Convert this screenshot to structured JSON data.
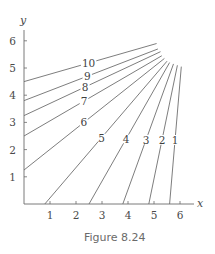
{
  "caption": "Figure 8.24",
  "chart_data": {
    "type": "line",
    "title": "",
    "xlabel": "x",
    "ylabel": "y",
    "xlim": [
      0,
      6.6
    ],
    "ylim": [
      0,
      6.6
    ],
    "xticks": [
      1,
      2,
      3,
      4,
      5,
      6
    ],
    "yticks": [
      1,
      2,
      3,
      4,
      5,
      6
    ],
    "grid": false,
    "legend": "inline labels on each curve",
    "series": [
      {
        "name": "10",
        "points": [
          [
            0,
            4.5
          ],
          [
            5.1,
            5.9
          ]
        ],
        "label_at": [
          2.45,
          5.3
        ]
      },
      {
        "name": "9",
        "points": [
          [
            0,
            3.8
          ],
          [
            5.15,
            5.7
          ]
        ],
        "label_at": [
          2.4,
          4.78
        ]
      },
      {
        "name": "8",
        "points": [
          [
            0,
            3.25
          ],
          [
            5.25,
            5.6
          ]
        ],
        "label_at": [
          2.35,
          4.3
        ]
      },
      {
        "name": "7",
        "points": [
          [
            0,
            2.5
          ],
          [
            5.3,
            5.45
          ]
        ],
        "label_at": [
          2.3,
          3.8
        ]
      },
      {
        "name": "6",
        "points": [
          [
            0,
            1.25
          ],
          [
            5.4,
            5.35
          ]
        ],
        "label_at": [
          2.3,
          3.0
        ]
      },
      {
        "name": "5",
        "points": [
          [
            0.8,
            0
          ],
          [
            5.5,
            5.25
          ]
        ],
        "label_at": [
          3.1,
          2.35
        ]
      },
      {
        "name": "4",
        "points": [
          [
            2.5,
            0
          ],
          [
            5.6,
            5.2
          ]
        ],
        "label_at": [
          4.0,
          2.35
        ]
      },
      {
        "name": "3",
        "points": [
          [
            3.8,
            0
          ],
          [
            5.75,
            5.15
          ]
        ],
        "label_at": [
          4.75,
          2.35
        ]
      },
      {
        "name": "2",
        "points": [
          [
            4.8,
            0
          ],
          [
            5.9,
            5.1
          ]
        ],
        "label_at": [
          5.35,
          2.35
        ]
      },
      {
        "name": "1",
        "points": [
          [
            5.6,
            0
          ],
          [
            6.05,
            5.05
          ]
        ],
        "label_at": [
          5.85,
          2.35
        ]
      }
    ]
  }
}
